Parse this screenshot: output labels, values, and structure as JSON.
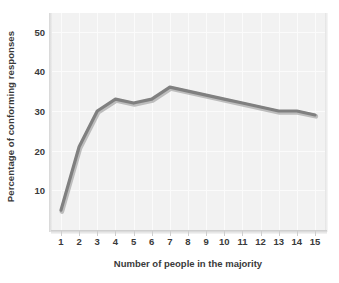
{
  "chart_data": {
    "type": "line",
    "title": "",
    "subtitle": "",
    "xlabel": "Number of people in the majority",
    "ylabel": "Percentage of conforming responses",
    "x": [
      1,
      2,
      3,
      4,
      5,
      6,
      7,
      8,
      9,
      10,
      11,
      12,
      13,
      14,
      15
    ],
    "values": [
      5,
      21,
      30,
      33,
      32,
      33,
      36,
      35,
      34,
      33,
      32,
      31,
      30,
      30,
      29
    ],
    "series": [
      {
        "name": "Conforming responses",
        "values": [
          5,
          21,
          30,
          33,
          32,
          33,
          36,
          35,
          34,
          33,
          32,
          31,
          30,
          30,
          29
        ]
      }
    ],
    "xlim": [
      0.45,
      15.55
    ],
    "ylim": [
      0,
      54.7
    ],
    "xticks": [
      1,
      2,
      3,
      4,
      5,
      6,
      7,
      8,
      9,
      10,
      11,
      12,
      13,
      14,
      15
    ],
    "xticklabels": [
      "1",
      "2",
      "3",
      "4",
      "5",
      "6",
      "7",
      "8",
      "9",
      "10",
      "11",
      "12",
      "13",
      "14",
      "15"
    ],
    "yticks": [
      10,
      20,
      30,
      40,
      50
    ],
    "yticklabels": [
      "10",
      "20",
      "30",
      "40",
      "50"
    ],
    "grid": true,
    "grid_axis": "both",
    "legend": false,
    "legend_position": "none",
    "annotations": [],
    "colors": {
      "line": "#808080",
      "line_shadow": "#bdbdbd",
      "plot_background": "#f2f2f2",
      "figure_background": "#ffffff",
      "gridline": "#fbfbfb",
      "tick_label": "#3a3a3a",
      "axis_title": "#3a3a3a",
      "axis_shadow": "#c9c9c9"
    },
    "line_width": 3.2
  }
}
